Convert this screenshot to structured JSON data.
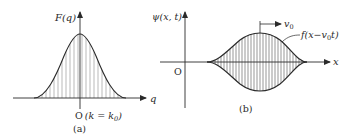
{
  "panel_a": {
    "y_label": "F(q)",
    "x_label": "q",
    "origin_label": "O",
    "origin_annotation": "(k = k",
    "origin_annotation_sub": "0",
    "origin_annotation_close": ")",
    "caption": "(a)"
  },
  "panel_b": {
    "y_label": "ψ(x, t)",
    "x_label": "x",
    "origin_label": "O",
    "velocity_label": "v",
    "velocity_sub": "0",
    "envelope_label": "f(x−v",
    "envelope_sub": "0",
    "envelope_label_close": "t)",
    "caption": "(b)"
  },
  "colors": {
    "ink": "#2a2a2a",
    "hatch": "#8a8a8a"
  }
}
